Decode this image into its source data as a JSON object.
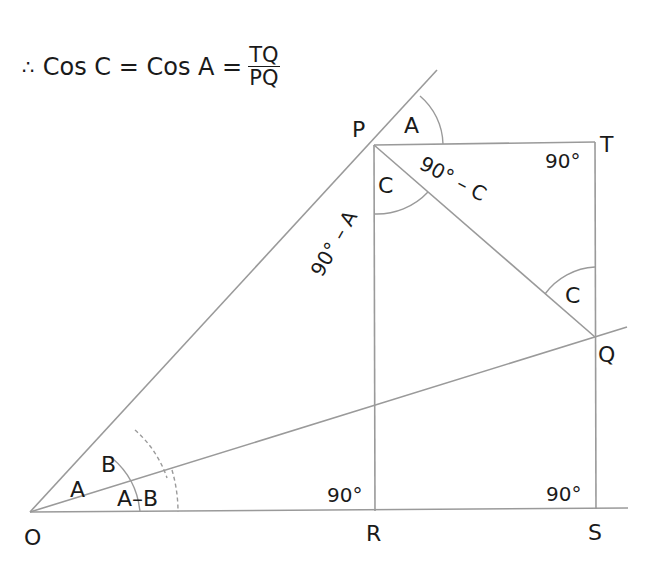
{
  "equation": {
    "therefore": "∴",
    "lhs": "Cos C = Cos A =",
    "numerator": "TQ",
    "denominator": "PQ"
  },
  "points": {
    "O": {
      "label": "O",
      "x": 30,
      "y": 512
    },
    "P": {
      "label": "P",
      "x": 374,
      "y": 145
    },
    "T": {
      "label": "T",
      "x": 595,
      "y": 142
    },
    "Q": {
      "label": "Q",
      "x": 595,
      "y": 337
    },
    "R": {
      "label": "R",
      "x": 375,
      "y": 511
    },
    "S": {
      "label": "S",
      "x": 596,
      "y": 509
    }
  },
  "angles": {
    "A_at_P": "A",
    "C_at_P": "C",
    "ninety_minus_C": "90° – C",
    "ninety_at_T": "90°",
    "ninety_minus_A": "90° – A",
    "C_at_Q": "C",
    "A_at_O": "A",
    "B_at_O": "B",
    "A_minus_B": "A–B",
    "ninety_at_R": "90°",
    "ninety_at_S": "90°"
  }
}
